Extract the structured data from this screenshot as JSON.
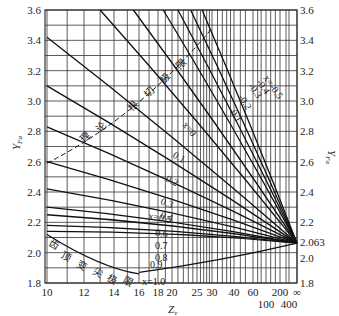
{
  "chart_data": {
    "type": "line",
    "title": "",
    "xlabel": "Zv",
    "ylabel": "YFa",
    "ylabel_right": "YFa",
    "ylim": [
      1.8,
      3.6
    ],
    "y_ticks": [
      1.8,
      2.0,
      2.2,
      2.4,
      2.6,
      2.8,
      3.0,
      3.2,
      3.4,
      3.6
    ],
    "y_ticks_right": [
      "1.8",
      "2.0",
      "2.063",
      "2.2",
      "2.4",
      "2.6",
      "2.8",
      "3.0",
      "3.2",
      "3.4",
      "3.6"
    ],
    "x_ticks_top_row": [
      "10",
      "12",
      "14",
      "16",
      "18",
      "20",
      "25",
      "30",
      "40",
      "60",
      "200",
      "∞"
    ],
    "x_ticks_bottom_row": [
      "100",
      "400"
    ],
    "convergence_value": 2.063,
    "annotations": {
      "undercut_limit": "理 论 根 切 极 限",
      "tip_limit": "齿 顶 变 尖 极 限"
    },
    "series": [
      {
        "name": "x=-0.5",
        "label": "x=-0.5",
        "start": [
          26.5,
          3.6
        ]
      },
      {
        "name": "x=-0.4",
        "label": "-0.4",
        "start": [
          23.5,
          3.6
        ]
      },
      {
        "name": "x=-0.3",
        "label": "-0.3",
        "start": [
          21,
          3.6
        ]
      },
      {
        "name": "x=-0.2",
        "label": "-0.2",
        "start": [
          18.7,
          3.6
        ]
      },
      {
        "name": "x=-0.1",
        "label": "-0.1",
        "start": [
          15.5,
          3.6
        ]
      },
      {
        "name": "x=0",
        "label": "x=0",
        "start": [
          13,
          3.6
        ]
      },
      {
        "name": "x=0.1",
        "label": "0.1",
        "start": [
          10,
          3.42
        ]
      },
      {
        "name": "x=0.2",
        "label": "0.2",
        "start": [
          10,
          3.1
        ]
      },
      {
        "name": "x=0.3",
        "label": "0.3",
        "start": [
          10,
          2.83
        ]
      },
      {
        "name": "x=0.4",
        "label": "0.4",
        "start": [
          10,
          2.6
        ]
      },
      {
        "name": "x=0.5",
        "label": "x=0.5",
        "start": [
          10,
          2.42
        ]
      },
      {
        "name": "x=0.6",
        "label": "0.6",
        "start": [
          10,
          2.3
        ]
      },
      {
        "name": "x=0.7",
        "label": "0.7",
        "start": [
          10,
          2.25
        ]
      },
      {
        "name": "x=0.8",
        "label": "0.8",
        "start": [
          10,
          2.18
        ]
      },
      {
        "name": "x=0.9",
        "label": "0.9",
        "start": [
          10,
          2.14
        ]
      },
      {
        "name": "x=1.0",
        "label": "x=1.0",
        "start": [
          16,
          1.87
        ]
      }
    ]
  }
}
